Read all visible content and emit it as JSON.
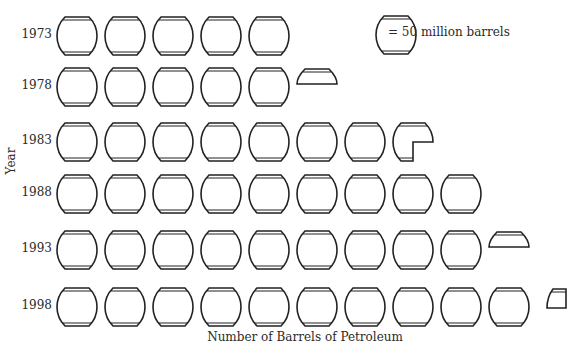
{
  "chart_data": {
    "type": "pictograph",
    "title": "",
    "xlabel": "Number of Barrels of Petroleum",
    "ylabel": "Year",
    "legend": {
      "icon": "barrel-icon",
      "text": "= 50 million barrels",
      "unit_value": 50
    },
    "categories": [
      "1973",
      "1978",
      "1983",
      "1988",
      "1993",
      "1998"
    ],
    "icon_counts": [
      5,
      5.4,
      7.75,
      9,
      9.4,
      10.25
    ],
    "values": [
      250,
      270,
      387.5,
      450,
      470,
      512.5
    ],
    "units": "million barrels"
  },
  "rows": [
    {
      "year": "1973",
      "full": 5,
      "partial": "none"
    },
    {
      "year": "1978",
      "full": 5,
      "partial": "top"
    },
    {
      "year": "1983",
      "full": 7,
      "partial": "three-quarter"
    },
    {
      "year": "1988",
      "full": 9,
      "partial": "none"
    },
    {
      "year": "1993",
      "full": 9,
      "partial": "top"
    },
    {
      "year": "1998",
      "full": 10,
      "partial": "quarter"
    }
  ],
  "legend_text": "= 50 million barrels",
  "xlabel": "Number of Barrels of Petroleum",
  "ylabel": "Year"
}
